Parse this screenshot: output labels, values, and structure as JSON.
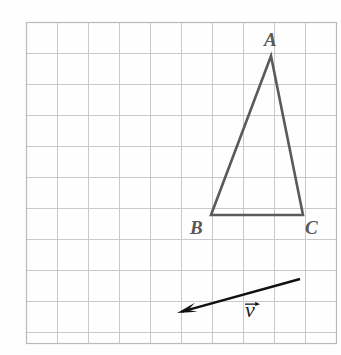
{
  "figure": {
    "width": 341,
    "height": 355,
    "background_color": "#fefefe"
  },
  "grid": {
    "line_color": "#c9c9cd",
    "border_color": "#b9b9be",
    "cell_size": 31,
    "origin_x": 26,
    "origin_y": 22,
    "columns": 10,
    "rows": 10,
    "right_edge": 336,
    "bottom_edge": 343
  },
  "triangle": {
    "stroke_color": "#5a5a5c",
    "stroke_width": 2.6,
    "fill": "none",
    "vertices": [
      {
        "name": "A",
        "label": "A",
        "x": 271,
        "y": 56,
        "label_x": 264,
        "label_y": 30
      },
      {
        "name": "B",
        "label": "B",
        "x": 211,
        "y": 215,
        "label_x": 190,
        "label_y": 218
      },
      {
        "name": "C",
        "label": "C",
        "x": 303,
        "y": 215,
        "label_x": 305,
        "label_y": 218
      }
    ],
    "path": "M 271 56 L 211 215 L 303 215 Z"
  },
  "vector": {
    "label": "ν",
    "label_description": "nu-with-overhead-arrow",
    "color": "#111111",
    "stroke_width": 2.4,
    "tail_x": 300,
    "tail_y": 279,
    "head_x": 177,
    "head_y": 313,
    "arrowhead_length": 20,
    "label_x": 245,
    "label_y": 299
  }
}
